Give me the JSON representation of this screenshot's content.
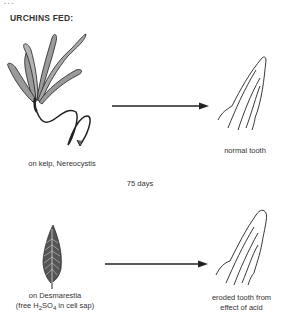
{
  "caption_fragment": "…",
  "heading": "URCHINS FED:",
  "duration": "75 days",
  "rows": [
    {
      "food_label": "on kelp, Nereocystis",
      "result_label": "normal tooth",
      "food_icon": "kelp-nereocystis-drawing",
      "result_icon": "normal-tooth-drawing"
    },
    {
      "food_label_line1": "on Desmarestia",
      "food_label_line2_pre": "(free H",
      "food_label_sub1": "2",
      "food_label_mid": "SO",
      "food_label_sub2": "4",
      "food_label_post": " in cell sap)",
      "result_label_line1": "eroded tooth from",
      "result_label_line2": "effect of acid",
      "food_icon": "desmarestia-drawing",
      "result_icon": "eroded-tooth-drawing"
    }
  ],
  "colors": {
    "ink": "#222222",
    "background": "#ffffff"
  }
}
